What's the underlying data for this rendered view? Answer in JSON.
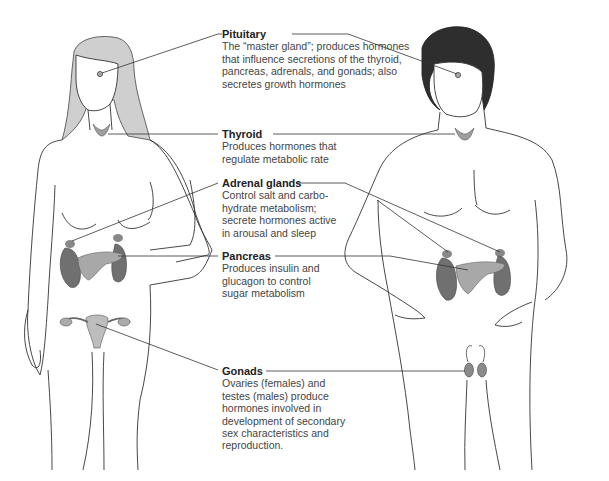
{
  "diagram": {
    "figures": [
      "female-figure",
      "male-figure"
    ],
    "colors": {
      "female_hair": "#c8c8c8",
      "male_hair": "#2a2a2a",
      "gland_dark": "#6e6e6e",
      "gland_light": "#a9a9a9",
      "outline": "#333333"
    },
    "labels": [
      {
        "id": "pituitary",
        "title": "Pituitary",
        "description": "The “master gland”; produces hormones that influence secretions of the thyroid, pancreas, adrenals, and gonads; also secretes growth hormones"
      },
      {
        "id": "thyroid",
        "title": "Thyroid",
        "description": "Produces hormones that regulate metabolic rate"
      },
      {
        "id": "adrenal-glands",
        "title": "Adrenal glands",
        "description": "Control salt and carbo-hydrate metabolism; secrete hormones active in arousal and sleep"
      },
      {
        "id": "pancreas",
        "title": "Pancreas",
        "description": "Produces insulin and glucagon to control sugar metabolism"
      },
      {
        "id": "gonads",
        "title": "Gonads",
        "description": "Ovaries (females) and testes (males) produce hormones involved in development of secondary sex characteristics and reproduction."
      }
    ]
  }
}
